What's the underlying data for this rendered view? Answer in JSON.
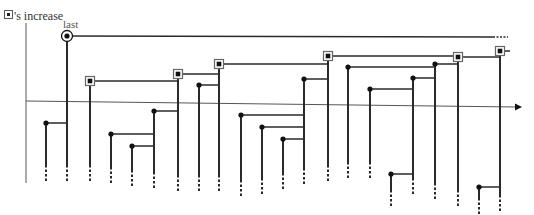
{
  "labels": {
    "y_axis": "'s increase",
    "last": "last"
  },
  "colors": {
    "line": "#2a2a2a",
    "axis": "#555555",
    "node": "#111111",
    "square_border": "#666666"
  },
  "axes": {
    "y_axis": {
      "x": 26,
      "y1": 23,
      "y2": 183
    },
    "x_axis": {
      "x1": 26,
      "y1": 101,
      "x2": 522,
      "y2": 107
    }
  },
  "nodes": [
    {
      "x": 46,
      "y": 123,
      "type": "dot",
      "link_to_x": 67,
      "bottom": 165
    },
    {
      "x": 67,
      "y": 36,
      "type": "circle",
      "link_to_x": 505,
      "bottom": 165,
      "dashed_link_end": true
    },
    {
      "x": 90,
      "y": 81,
      "type": "square",
      "link_to_x": 178,
      "bottom": 165
    },
    {
      "x": 111,
      "y": 134,
      "type": "dot",
      "link_to_x": 154,
      "bottom": 167
    },
    {
      "x": 132,
      "y": 146,
      "type": "dot",
      "link_to_x": 154,
      "bottom": 170
    },
    {
      "x": 154,
      "y": 111,
      "type": "dot",
      "link_to_x": 178,
      "bottom": 172
    },
    {
      "x": 178,
      "y": 74,
      "type": "square",
      "link_to_x": 219,
      "bottom": 175
    },
    {
      "x": 199,
      "y": 85,
      "type": "dot",
      "link_to_x": 219,
      "bottom": 175
    },
    {
      "x": 219,
      "y": 64,
      "type": "square",
      "link_to_x": 328,
      "bottom": 175
    },
    {
      "x": 241,
      "y": 115,
      "type": "dot",
      "link_to_x": 304,
      "bottom": 180
    },
    {
      "x": 262,
      "y": 127,
      "type": "dot",
      "link_to_x": 304,
      "bottom": 178
    },
    {
      "x": 283,
      "y": 139,
      "type": "dot",
      "link_to_x": 304,
      "bottom": 173
    },
    {
      "x": 304,
      "y": 79,
      "type": "dot",
      "link_to_x": 328,
      "bottom": 168
    },
    {
      "x": 328,
      "y": 56,
      "type": "square",
      "link_to_x": 458,
      "bottom": 165
    },
    {
      "x": 348,
      "y": 67,
      "type": "dot",
      "link_to_x": 435,
      "bottom": 162
    },
    {
      "x": 370,
      "y": 89,
      "type": "dot",
      "link_to_x": 413,
      "bottom": 162
    },
    {
      "x": 391,
      "y": 174,
      "type": "dot",
      "link_to_x": 413,
      "bottom": 190
    },
    {
      "x": 413,
      "y": 78,
      "type": "dot",
      "link_to_x": 435,
      "bottom": 178
    },
    {
      "x": 435,
      "y": 64,
      "type": "dot",
      "link_to_x": 458,
      "bottom": 183
    },
    {
      "x": 458,
      "y": 57,
      "type": "square",
      "link_to_x": 500,
      "bottom": 190
    },
    {
      "x": 479,
      "y": 187,
      "type": "dot",
      "link_to_x": 500,
      "bottom": 198
    },
    {
      "x": 500,
      "y": 51,
      "type": "square",
      "link_to_x": 510,
      "bottom": 195
    }
  ]
}
